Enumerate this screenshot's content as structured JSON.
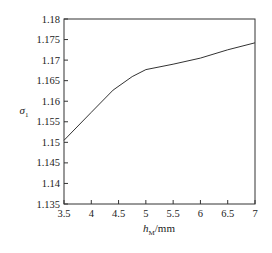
{
  "chart_data": {
    "type": "line",
    "title": "",
    "xlabel": "h_M/mm",
    "xlabel_main": "h",
    "xlabel_sub": "M",
    "xlabel_unit": "/mm",
    "ylabel": "σ1",
    "ylabel_main": "σ",
    "ylabel_sub": "1",
    "xlim": [
      3.5,
      7
    ],
    "ylim": [
      1.135,
      1.18
    ],
    "xticks": [
      "3.5",
      "4",
      "4.5",
      "5",
      "5.5",
      "6",
      "6.5",
      "7"
    ],
    "yticks": [
      "1.135",
      "1.14",
      "1.145",
      "1.15",
      "1.155",
      "1.16",
      "1.165",
      "1.17",
      "1.175",
      "1.18"
    ],
    "grid": false,
    "legend": null,
    "series": [
      {
        "name": "σ1",
        "color": "#333333",
        "x": [
          3.5,
          4.0,
          4.4,
          4.75,
          5.0,
          5.5,
          6.0,
          6.5,
          7.0
        ],
        "values": [
          1.1505,
          1.1573,
          1.1627,
          1.166,
          1.1677,
          1.169,
          1.1705,
          1.1725,
          1.1742
        ]
      }
    ]
  }
}
